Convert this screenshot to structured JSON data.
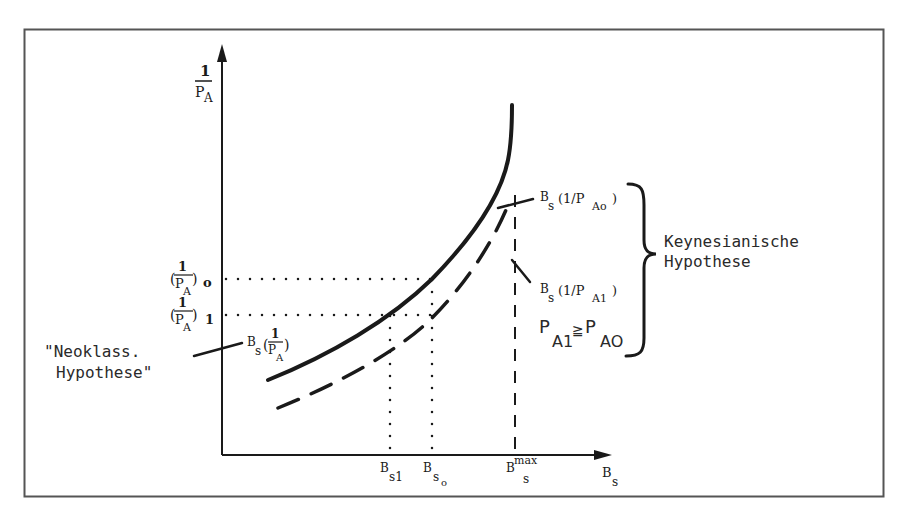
{
  "diagram": {
    "frame_color": "#555555",
    "ink_color": "#1a1a1a",
    "axes": {
      "y_label_num": "1",
      "y_label_den": "P",
      "y_label_den_sub": "A",
      "x_label": "B",
      "x_label_sub": "s"
    },
    "y_ticks": [
      {
        "num": "1",
        "den": "P",
        "den_sub": "A",
        "sub": "o",
        "open": "(",
        "close": ")"
      },
      {
        "num": "1",
        "den": "P",
        "den_sub": "A",
        "sub": "1",
        "open": "(",
        "close": ")"
      }
    ],
    "x_ticks": [
      {
        "main": "B",
        "sub": "s1"
      },
      {
        "main": "B",
        "sub": "s",
        "subsub": "o"
      },
      {
        "main": "B",
        "sub": "s",
        "sup": "max"
      }
    ],
    "curves": {
      "solid": {
        "label_main": "B",
        "label_sub": "s",
        "label_open": "(",
        "label_num": "1",
        "label_den": "P",
        "label_den_sub": "A",
        "label_close": ")"
      },
      "solid_upper": {
        "label_main": "B",
        "label_sub": "s",
        "label_arg": "(1/P",
        "label_arg_sub": "Ao",
        "label_close": ")"
      },
      "dashed": {
        "label_main": "B",
        "label_sub": "s",
        "label_arg": "(1/P",
        "label_arg_sub": "A1",
        "label_close": ")"
      }
    },
    "annotations": {
      "neoklass_line1": "\"Neoklass.",
      "neoklass_line2": "Hypothese\"",
      "keynes_line1": "Keynesianische",
      "keynes_line2": "Hypothese",
      "inequality_p1": "P",
      "inequality_p1_sub": "A1",
      "inequality_op": "≧",
      "inequality_p2": "P",
      "inequality_p2_sub": "AO"
    }
  }
}
